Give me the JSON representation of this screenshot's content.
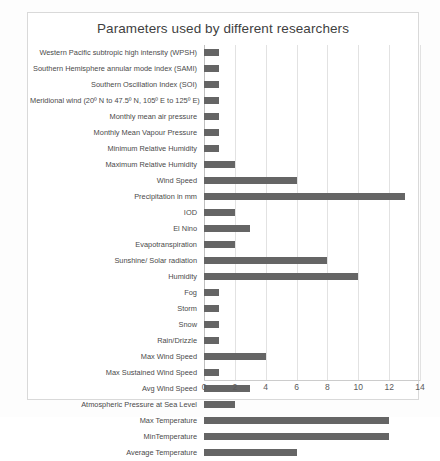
{
  "chart_data": {
    "type": "bar",
    "orientation": "horizontal",
    "title": "Parameters used  by different researchers",
    "xlabel": "",
    "ylabel": "",
    "xlim": [
      0,
      14
    ],
    "xticks": [
      0,
      2,
      4,
      6,
      8,
      10,
      12,
      14
    ],
    "grid": true,
    "legend": "none",
    "bar_color": "#656565",
    "categories": [
      "Western Pacific subtropic high intensity (WPSH)",
      "Southern Hemisphere annular mode index (SAMI)",
      "Southern Oscillation Index (SOI)",
      "Meridional wind (20º N to 47.5º N, 105º E to 125º E)…",
      "Monthly mean air pressure",
      "Monthly Mean Vapour Pressure",
      "Minimum Relative Humidity",
      "Maximum Relative Humidity",
      "Wind Speed",
      "Precipitation in mm",
      "IOD",
      "El Nino",
      "Evapotranspiration",
      "Sunshine/ Solar  radiation",
      "Humidity",
      "Fog",
      "Storm",
      "Snow",
      "Rain/Drizzle",
      "Max Wind Speed",
      "Max Sustained Wind Speed",
      "Avg Wind Speed",
      "Atmospheric Pressure at Sea Level",
      "Max Temperature",
      "MinTemperature",
      "Average Temperature"
    ],
    "values": [
      1,
      1,
      1,
      1,
      1,
      1,
      1,
      2,
      6,
      13,
      2,
      3,
      2,
      8,
      10,
      1,
      1,
      1,
      1,
      4,
      1,
      3,
      2,
      12,
      12,
      6
    ]
  },
  "footer": {
    "caption": ""
  }
}
